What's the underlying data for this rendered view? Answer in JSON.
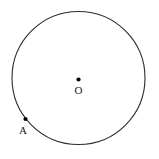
{
  "figure": {
    "type": "geometry-diagram",
    "canvas": {
      "width": 159,
      "height": 159,
      "background_color": "#ffffff"
    },
    "style": {
      "stroke_color": "#2b2b2b",
      "stroke_width": 1.1,
      "point_color": "#000000",
      "point_radius": 2.1,
      "label_color": "#1a1a1a",
      "label_font_size": 11
    },
    "circle": {
      "name": "main-circle",
      "center_x": 78.5,
      "center_y": 78,
      "radius": 66.5,
      "filled": false
    },
    "points": [
      {
        "id": "O",
        "label": "O",
        "role": "center",
        "x": 78.5,
        "y": 79.5,
        "label_x": 78.5,
        "label_y": 94
      },
      {
        "id": "A",
        "label": "A",
        "role": "on-circumference",
        "x": 25.5,
        "y": 119,
        "label_x": 23,
        "label_y": 134
      }
    ]
  }
}
